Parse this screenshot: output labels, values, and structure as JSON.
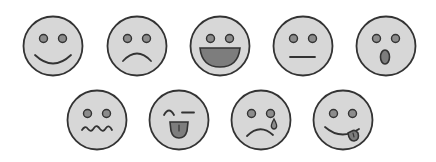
{
  "colors": {
    "background": "#ffffff",
    "face_fill": "#d7d7d7",
    "stroke": "#333333",
    "eye_fill": "#8c8c8c",
    "mouth_fill": "#7d7d7d"
  },
  "faces": [
    {
      "expression": "smile",
      "cx": 53,
      "cy": 46
    },
    {
      "expression": "sad",
      "cx": 137,
      "cy": 46
    },
    {
      "expression": "laugh",
      "cx": 220,
      "cy": 46
    },
    {
      "expression": "neutral",
      "cx": 303,
      "cy": 46
    },
    {
      "expression": "surprised",
      "cx": 386,
      "cy": 46
    },
    {
      "expression": "queasy",
      "cx": 97,
      "cy": 120
    },
    {
      "expression": "wink-tongue",
      "cx": 179,
      "cy": 120
    },
    {
      "expression": "crying",
      "cx": 261,
      "cy": 120
    },
    {
      "expression": "silly-tongue",
      "cx": 343,
      "cy": 120
    }
  ]
}
